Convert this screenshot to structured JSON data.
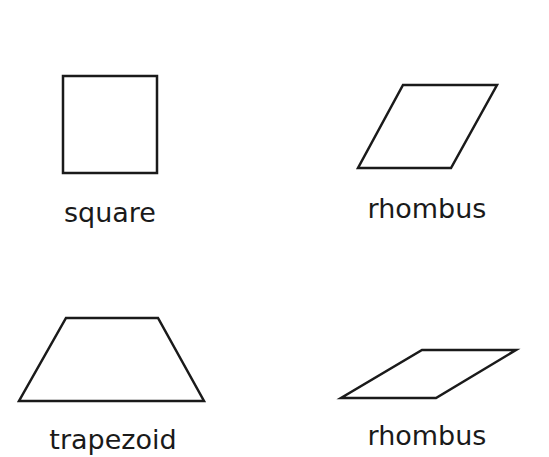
{
  "shapes": [
    {
      "name": "square",
      "label": "square",
      "points": "63,76 157,76 157,173 63,173",
      "label_x": 110,
      "label_y": 222
    },
    {
      "name": "rhombus",
      "label": "rhombus",
      "points": "403,85 497,85 451,168 358,168",
      "label_x": 427,
      "label_y": 218
    },
    {
      "name": "trapezoid",
      "label": "trapezoid",
      "points": "66,318 158,318 204,401 19,401",
      "label_x": 113,
      "label_y": 449
    },
    {
      "name": "rhombus",
      "label": "rhombus",
      "points": "422,350 516,350 436,398 341,398",
      "label_x": 427,
      "label_y": 445
    }
  ]
}
